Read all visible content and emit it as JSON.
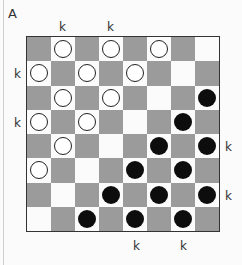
{
  "diagram_label": "A",
  "king_marker": "k",
  "colors": {
    "dark_square": "#9b9b9b",
    "light_square": "#fbfbfb",
    "white_piece": "#ffffff",
    "black_piece": "#0d0d0d"
  },
  "board": {
    "size": 8,
    "rows": [
      [
        "",
        "W",
        "",
        "W",
        "",
        "W",
        "",
        ""
      ],
      [
        "W",
        "",
        "W",
        "",
        "W",
        "",
        "",
        ""
      ],
      [
        "",
        "W",
        "",
        "W",
        "",
        "",
        "",
        "B"
      ],
      [
        "W",
        "",
        "W",
        "",
        "",
        "",
        "B",
        ""
      ],
      [
        "",
        "W",
        "",
        "",
        "",
        "B",
        "",
        "B"
      ],
      [
        "W",
        "",
        "",
        "",
        "B",
        "",
        "B",
        ""
      ],
      [
        "",
        "",
        "",
        "B",
        "",
        "B",
        "",
        "B"
      ],
      [
        "",
        "",
        "B",
        "",
        "B",
        "",
        "B",
        ""
      ]
    ]
  },
  "king_labels": [
    {
      "text": "k",
      "side": "top",
      "col": 1
    },
    {
      "text": "k",
      "side": "top",
      "col": 3
    },
    {
      "text": "k",
      "side": "left",
      "row": 1
    },
    {
      "text": "k",
      "side": "left",
      "row": 3
    },
    {
      "text": "k",
      "side": "right",
      "row": 4
    },
    {
      "text": "k",
      "side": "right",
      "row": 6
    },
    {
      "text": "k",
      "side": "bottom",
      "col": 4
    },
    {
      "text": "k",
      "side": "bottom",
      "col": 6
    }
  ]
}
